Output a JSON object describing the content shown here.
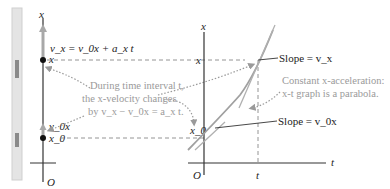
{
  "left_panel": {
    "axis_label": "x",
    "origin_label": "O",
    "velocity_eq": "v_x = v_0x + a_x t",
    "upper_point_label": "x",
    "lower_velocity_label": "v_0x",
    "lower_point_label": "x_0"
  },
  "annotation_center": {
    "line1": "During time interval t,",
    "line2": "the x-velocity changes",
    "line3": "by v_x − v_0x = a_x t."
  },
  "right_graph": {
    "y_axis_label": "x",
    "x_axis_label": "t",
    "origin_label": "O",
    "y_tick_x": "x",
    "y_tick_x0": "x_0",
    "x_tick_t": "t",
    "slope_upper": "Slope = v_x",
    "slope_lower": "Slope = v_0x"
  },
  "annotation_right": {
    "line1": "Constant x-acceleration:",
    "line2": "x-t graph is a parabola."
  },
  "colors": {
    "axis": "#333333",
    "curve": "#a0a0a0",
    "tangent": "#b0b0b0",
    "dashed": "#888888",
    "dotted_arrow": "#9a9a9a",
    "note_text": "#9a9a9a",
    "strip": "#d8d8d8"
  }
}
